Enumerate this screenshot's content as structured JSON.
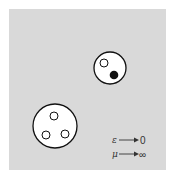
{
  "diagram": {
    "background": "#d9d9d9",
    "border_color": "#ffffff",
    "meson": {
      "label": "meson",
      "bag": {
        "cx": 110,
        "cy": 68,
        "r": 16
      },
      "quarks": [
        {
          "type": "quark",
          "filled": false,
          "cx": 104,
          "cy": 63,
          "r": 4
        },
        {
          "type": "antiquark",
          "filled": true,
          "cx": 114,
          "cy": 75,
          "r": 4
        }
      ]
    },
    "baryon": {
      "label": "baryon",
      "bag": {
        "cx": 55,
        "cy": 126,
        "r": 22
      },
      "quarks": [
        {
          "type": "quark",
          "filled": false,
          "cx": 54,
          "cy": 116,
          "r": 4
        },
        {
          "type": "quark",
          "filled": false,
          "cx": 46,
          "cy": 135,
          "r": 4
        },
        {
          "type": "quark",
          "filled": false,
          "cx": 65,
          "cy": 134,
          "r": 4
        }
      ]
    },
    "limits": [
      {
        "symbol": "ε",
        "value": "0"
      },
      {
        "symbol": "μ",
        "value": "∞"
      }
    ]
  }
}
